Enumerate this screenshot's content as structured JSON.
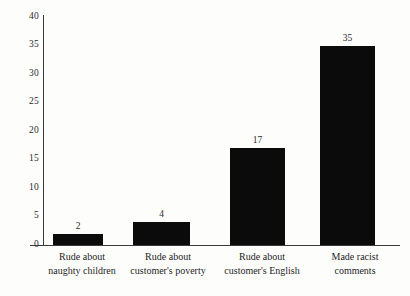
{
  "chart_data": {
    "type": "bar",
    "title": "",
    "subtitle": "",
    "xlabel": "",
    "ylabel": "",
    "ylim": [
      0,
      40
    ],
    "ytick_step": 5,
    "yticks": [
      "40",
      "35",
      "30",
      "25",
      "20",
      "15",
      "10",
      "5",
      "0"
    ],
    "grid": false,
    "legend": false,
    "bar_color": "#0b0b0b",
    "axis_color": "#3a3a3a",
    "background_color": "#fdfdfc",
    "categories": [
      "Rude about naughty children",
      "Rude about customer's poverty",
      "Rude about customer's English",
      "Made racist comments"
    ],
    "category_lines": [
      [
        "Rude about",
        "naughty children"
      ],
      [
        "Rude about",
        "customer's poverty"
      ],
      [
        "Rude about",
        "customer's English"
      ],
      [
        "Made racist",
        "comments"
      ]
    ],
    "values": [
      2,
      4,
      17,
      35
    ],
    "value_labels": [
      "2",
      "4",
      "17",
      "35"
    ]
  }
}
